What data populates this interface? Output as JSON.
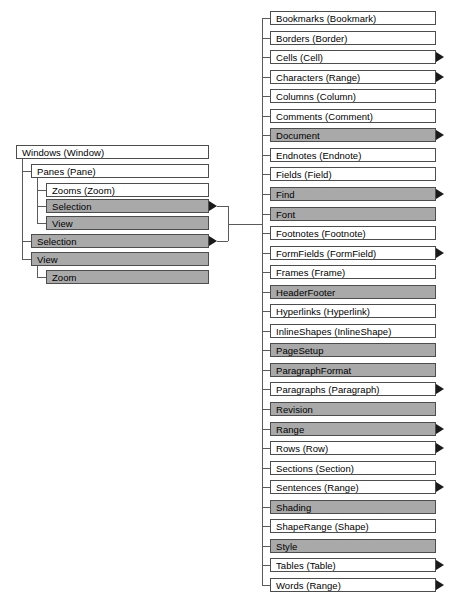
{
  "diagram": {
    "colors": {
      "node_fill_plain": "#ffffff",
      "node_fill_shaded": "#a9a9a9",
      "node_border": "#4d4d4d",
      "connector": "#5a5a5a",
      "arrow": "#1a1a1a",
      "text": "#000000",
      "background": "#ffffff"
    },
    "left_tree": {
      "root": {
        "label": "Windows (Window)",
        "shaded": false,
        "arrow": false,
        "x": 16,
        "y": 145,
        "w": 193,
        "h": 14
      },
      "nodes": [
        {
          "label": "Panes (Pane)",
          "shaded": false,
          "arrow": false,
          "x": 31,
          "y": 164,
          "w": 178,
          "h": 14,
          "level": 1
        },
        {
          "label": "Zooms (Zoom)",
          "shaded": false,
          "arrow": false,
          "x": 46,
          "y": 183,
          "w": 163,
          "h": 14,
          "level": 2
        },
        {
          "label": "Selection",
          "shaded": true,
          "arrow": true,
          "x": 46,
          "y": 199,
          "w": 163,
          "h": 14,
          "level": 2
        },
        {
          "label": "View",
          "shaded": true,
          "arrow": false,
          "x": 46,
          "y": 216,
          "w": 163,
          "h": 14,
          "level": 2
        },
        {
          "label": "Selection",
          "shaded": true,
          "arrow": true,
          "x": 31,
          "y": 234,
          "w": 178,
          "h": 14,
          "level": 1
        },
        {
          "label": "View",
          "shaded": true,
          "arrow": false,
          "x": 31,
          "y": 252,
          "w": 178,
          "h": 14,
          "level": 1
        },
        {
          "label": "Zoom",
          "shaded": true,
          "arrow": false,
          "x": 46,
          "y": 270,
          "w": 163,
          "h": 14,
          "level": 2
        }
      ]
    },
    "right_column": {
      "x": 270,
      "width": 166,
      "row_height": 14,
      "row_pitch": 19.55,
      "first_row_y": 11,
      "items": [
        {
          "label": "Bookmarks (Bookmark)",
          "shaded": false,
          "arrow": false
        },
        {
          "label": "Borders (Border)",
          "shaded": false,
          "arrow": false
        },
        {
          "label": "Cells (Cell)",
          "shaded": false,
          "arrow": true
        },
        {
          "label": "Characters (Range)",
          "shaded": false,
          "arrow": true
        },
        {
          "label": "Columns (Column)",
          "shaded": false,
          "arrow": false
        },
        {
          "label": "Comments (Comment)",
          "shaded": false,
          "arrow": false
        },
        {
          "label": "Document",
          "shaded": true,
          "arrow": true
        },
        {
          "label": "Endnotes (Endnote)",
          "shaded": false,
          "arrow": false
        },
        {
          "label": "Fields (Field)",
          "shaded": false,
          "arrow": false
        },
        {
          "label": "Find",
          "shaded": true,
          "arrow": true
        },
        {
          "label": "Font",
          "shaded": true,
          "arrow": false
        },
        {
          "label": "Footnotes (Footnote)",
          "shaded": false,
          "arrow": false
        },
        {
          "label": "FormFields (FormField)",
          "shaded": false,
          "arrow": true
        },
        {
          "label": "Frames (Frame)",
          "shaded": false,
          "arrow": false
        },
        {
          "label": "HeaderFooter",
          "shaded": true,
          "arrow": false
        },
        {
          "label": "Hyperlinks (Hyperlink)",
          "shaded": false,
          "arrow": false
        },
        {
          "label": "InlineShapes (InlineShape)",
          "shaded": false,
          "arrow": false
        },
        {
          "label": "PageSetup",
          "shaded": true,
          "arrow": false
        },
        {
          "label": "ParagraphFormat",
          "shaded": true,
          "arrow": false
        },
        {
          "label": "Paragraphs (Paragraph)",
          "shaded": false,
          "arrow": true
        },
        {
          "label": "Revision",
          "shaded": true,
          "arrow": false
        },
        {
          "label": "Range",
          "shaded": true,
          "arrow": true
        },
        {
          "label": "Rows (Row)",
          "shaded": false,
          "arrow": true
        },
        {
          "label": "Sections (Section)",
          "shaded": false,
          "arrow": false
        },
        {
          "label": "Sentences (Range)",
          "shaded": false,
          "arrow": true
        },
        {
          "label": "Shading",
          "shaded": true,
          "arrow": false
        },
        {
          "label": "ShapeRange (Shape)",
          "shaded": false,
          "arrow": false
        },
        {
          "label": "Style",
          "shaded": true,
          "arrow": false
        },
        {
          "label": "Tables (Table)",
          "shaded": false,
          "arrow": true
        },
        {
          "label": "Words (Range)",
          "shaded": false,
          "arrow": true
        }
      ]
    }
  }
}
